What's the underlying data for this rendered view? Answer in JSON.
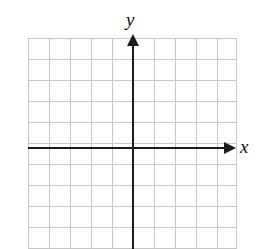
{
  "figure": {
    "width": 258,
    "height": 249,
    "background_color": "#ffffff"
  },
  "axes": {
    "x_axis": {
      "label": "x",
      "color": "#1c1c1c",
      "arrow_direction": "right"
    },
    "y_axis": {
      "label": "y",
      "color": "#1c1c1c",
      "arrow_direction": "up"
    },
    "origin": {
      "x": 133,
      "y": 148
    }
  },
  "grid": {
    "line_color": "#c6c6c6",
    "border_color": "#bdbdbd",
    "cell_size": 21,
    "columns": 10,
    "rows": 10,
    "vertical_lines": [
      0,
      21,
      42,
      63,
      84,
      105,
      126,
      147,
      168,
      189,
      208
    ],
    "horizontal_lines": [
      0,
      21,
      42,
      63,
      84,
      105,
      126,
      147,
      168,
      189,
      210
    ]
  },
  "chart_data": {
    "type": "scatter",
    "title": "",
    "xlabel": "x",
    "ylabel": "y",
    "xlim": [
      -5,
      5
    ],
    "ylim": [
      -5,
      5
    ],
    "grid": true,
    "legend": null,
    "series": [],
    "x": [],
    "values": [],
    "annotations": [],
    "note": "Empty coordinate plane — no data plotted."
  }
}
